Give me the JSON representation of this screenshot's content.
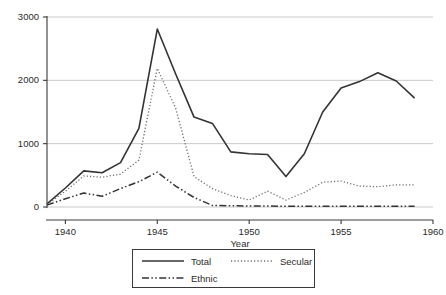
{
  "chart_data": {
    "type": "line",
    "title": "",
    "subtitle": "",
    "xlabel": "Year",
    "ylabel": "",
    "xlim": [
      1939,
      1960
    ],
    "ylim": [
      0,
      3000
    ],
    "grid": true,
    "grid_axis": "y",
    "legend_position": "bottom",
    "x": [
      1939,
      1940,
      1941,
      1942,
      1943,
      1944,
      1945,
      1946,
      1947,
      1948,
      1949,
      1950,
      1951,
      1952,
      1953,
      1954,
      1955,
      1956,
      1957,
      1958,
      1959
    ],
    "xticks": [
      1940,
      1945,
      1950,
      1955,
      1960
    ],
    "xtick_labels": [
      "1940",
      "1945",
      "1950",
      "1955",
      "1960"
    ],
    "yticks": [
      0,
      1000,
      2000,
      3000
    ],
    "ytick_labels": [
      "0",
      "1000",
      "2000",
      "3000"
    ],
    "series": [
      {
        "name": "Total",
        "style": "solid",
        "color": "#333333",
        "values": [
          50,
          300,
          570,
          540,
          700,
          1240,
          2810,
          2100,
          1420,
          1320,
          870,
          840,
          830,
          480,
          840,
          1500,
          1880,
          1980,
          2120,
          1990,
          1720
        ]
      },
      {
        "name": "Secular",
        "style": "dotted",
        "color": "#6b6b6b",
        "values": [
          40,
          250,
          490,
          470,
          520,
          740,
          2190,
          1560,
          480,
          290,
          180,
          110,
          250,
          110,
          230,
          390,
          410,
          330,
          320,
          350,
          350
        ]
      },
      {
        "name": "Ethnic",
        "style": "dash-dot-dot",
        "color": "#333333",
        "values": [
          30,
          130,
          220,
          170,
          290,
          400,
          550,
          330,
          150,
          25,
          20,
          15,
          15,
          12,
          12,
          12,
          10,
          10,
          10,
          10,
          10
        ]
      }
    ]
  },
  "legend": {
    "entries": [
      {
        "label": "Total"
      },
      {
        "label": "Secular"
      },
      {
        "label": "Ethnic"
      }
    ]
  },
  "colors": {
    "axis": "#3a3a3a",
    "grid": "#c9c9c9",
    "text": "#2a2a2a",
    "background": "#ffffff"
  }
}
